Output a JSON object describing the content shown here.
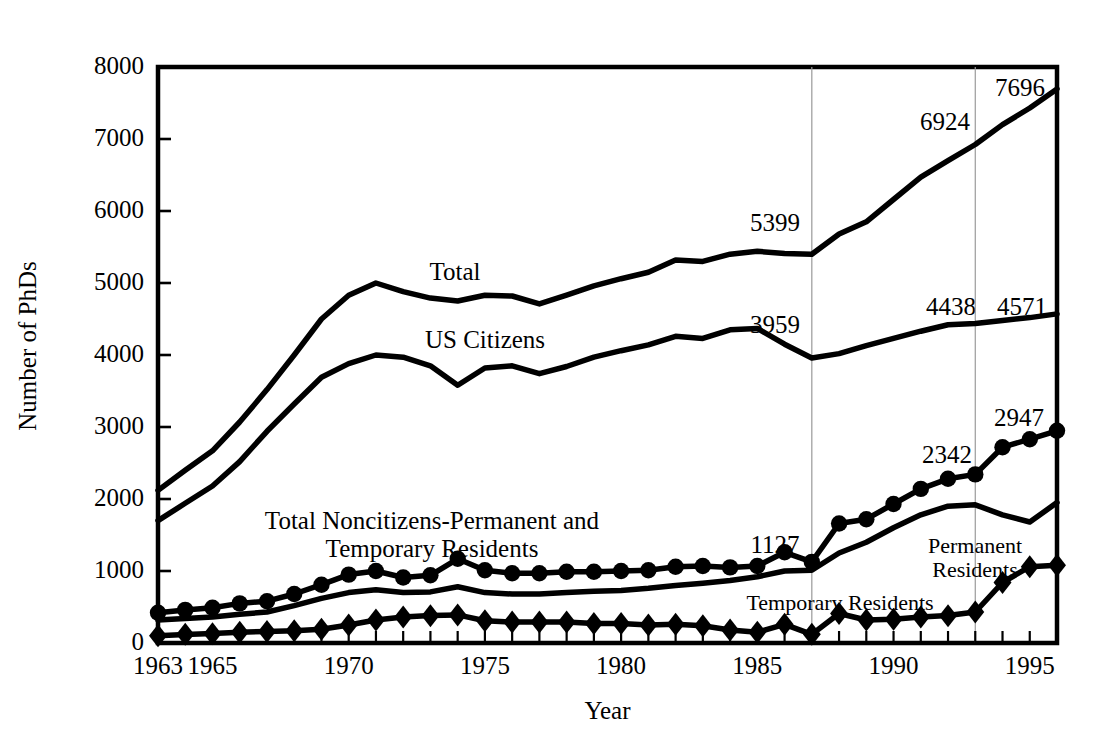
{
  "figure": {
    "title": "PhDs Awarded in Physics by Citizenship, 1963-1996",
    "title_visible": false
  },
  "axes": {
    "y_label": "Number of PhDs",
    "x_label": "Year",
    "y_ticks": [
      0,
      1000,
      2000,
      3000,
      4000,
      5000,
      6000,
      7000,
      8000
    ],
    "y_tick_labels": [
      "0",
      "1000",
      "2000",
      "3000",
      "4000",
      "5000",
      "6000",
      "7000",
      "8000"
    ],
    "x_tick_labels": [
      "1963",
      "1965",
      "1970",
      "1975",
      "1980",
      "1985",
      "1990",
      "1995"
    ],
    "x_tick_years": [
      1963,
      1965,
      1970,
      1975,
      1980,
      1985,
      1990,
      1995
    ],
    "ylim": [
      0,
      8000
    ],
    "xlim": [
      1963,
      1996
    ],
    "grid": "two vertical reference lines at 1987 and 1993",
    "gridline_years": [
      1987,
      1993
    ]
  },
  "series_labels": {
    "total": "Total",
    "us_citizens": "US Citizens",
    "noncitizens": "Total Noncitizens-Permanent and Temporary Residents",
    "noncitizens_line1": "Total Noncitizens-Permanent and",
    "noncitizens_line2": "Temporary Residents",
    "permanent": "Permanent Residents",
    "permanent_line1": "Permanent",
    "permanent_line2": "Residents",
    "temporary": "Temporary Residents"
  },
  "value_annotations": [
    {
      "name": "total-1987",
      "text": "5399",
      "year": 1987,
      "value": 5399,
      "x_px": 775,
      "y_px": 223
    },
    {
      "name": "total-1993",
      "text": "6924",
      "year": 1993,
      "value": 6924,
      "x_px": 945,
      "y_px": 122
    },
    {
      "name": "total-1996",
      "text": "7696",
      "year": 1996,
      "value": 7696,
      "x_px": 1020,
      "y_px": 88
    },
    {
      "name": "us-citizens-1987",
      "text": "3959",
      "year": 1987,
      "value": 3959,
      "x_px": 775,
      "y_px": 325
    },
    {
      "name": "us-citizens-1993",
      "text": "4438",
      "year": 1993,
      "value": 4438,
      "x_px": 951,
      "y_px": 307
    },
    {
      "name": "us-citizens-1996",
      "text": "4571",
      "year": 1996,
      "value": 4571,
      "x_px": 1022,
      "y_px": 307
    },
    {
      "name": "noncitizens-1987",
      "text": "1127",
      "year": 1987,
      "value": 1127,
      "x_px": 775,
      "y_px": 545
    },
    {
      "name": "noncitizens-1993",
      "text": "2342",
      "year": 1993,
      "value": 2342,
      "x_px": 947,
      "y_px": 455
    },
    {
      "name": "noncitizens-1996",
      "text": "2947",
      "year": 1996,
      "value": 2947,
      "x_px": 1019,
      "y_px": 418
    }
  ],
  "chart_data": {
    "type": "line",
    "title": "PhDs Awarded in Physics by Citizenship",
    "xlabel": "Year",
    "ylabel": "Number of PhDs",
    "ylim": [
      0,
      8000
    ],
    "xlim": [
      1963,
      1996
    ],
    "grid": false,
    "legend": "inline labels on curves",
    "x": [
      1963,
      1964,
      1965,
      1966,
      1967,
      1968,
      1969,
      1970,
      1971,
      1972,
      1973,
      1974,
      1975,
      1976,
      1977,
      1978,
      1979,
      1980,
      1981,
      1982,
      1983,
      1984,
      1985,
      1986,
      1987,
      1988,
      1989,
      1990,
      1991,
      1992,
      1993,
      1994,
      1995,
      1996
    ],
    "series": [
      {
        "name": "Total",
        "marker": "none",
        "values": [
          2120,
          2400,
          2670,
          3070,
          3520,
          4000,
          4500,
          4830,
          5000,
          4880,
          4790,
          4750,
          4830,
          4820,
          4710,
          4830,
          4960,
          5060,
          5150,
          5320,
          5300,
          5400,
          5440,
          5410,
          5399,
          5680,
          5850,
          6160,
          6470,
          6700,
          6924,
          7200,
          7430,
          7696
        ]
      },
      {
        "name": "US Citizens",
        "marker": "none",
        "values": [
          1700,
          1940,
          2180,
          2520,
          2940,
          3320,
          3690,
          3880,
          4000,
          3970,
          3850,
          3580,
          3820,
          3850,
          3740,
          3840,
          3970,
          4060,
          4140,
          4260,
          4230,
          4350,
          4370,
          4150,
          3959,
          4020,
          4130,
          4230,
          4330,
          4420,
          4438,
          4480,
          4520,
          4571
        ]
      },
      {
        "name": "Total Noncitizens-Permanent and Temporary Residents",
        "marker": "circle",
        "values": [
          420,
          460,
          490,
          550,
          580,
          680,
          810,
          950,
          1000,
          910,
          940,
          1170,
          1010,
          970,
          970,
          990,
          990,
          1000,
          1010,
          1060,
          1070,
          1050,
          1070,
          1260,
          1127,
          1660,
          1720,
          1930,
          2140,
          2280,
          2342,
          2720,
          2830,
          2947
        ]
      },
      {
        "name": "Temporary Residents",
        "marker": "none",
        "values": [
          320,
          340,
          360,
          400,
          430,
          520,
          620,
          700,
          740,
          700,
          710,
          780,
          700,
          680,
          680,
          700,
          720,
          730,
          760,
          800,
          830,
          870,
          920,
          1000,
          1010,
          1250,
          1400,
          1600,
          1780,
          1900,
          1920,
          1780,
          1680,
          1950
        ]
      },
      {
        "name": "Permanent Residents",
        "marker": "diamond",
        "values": [
          100,
          120,
          130,
          150,
          160,
          170,
          190,
          250,
          320,
          360,
          380,
          390,
          310,
          290,
          290,
          290,
          270,
          270,
          250,
          260,
          240,
          180,
          150,
          260,
          120,
          410,
          320,
          330,
          360,
          380,
          430,
          840,
          1060,
          1080
        ]
      }
    ]
  }
}
